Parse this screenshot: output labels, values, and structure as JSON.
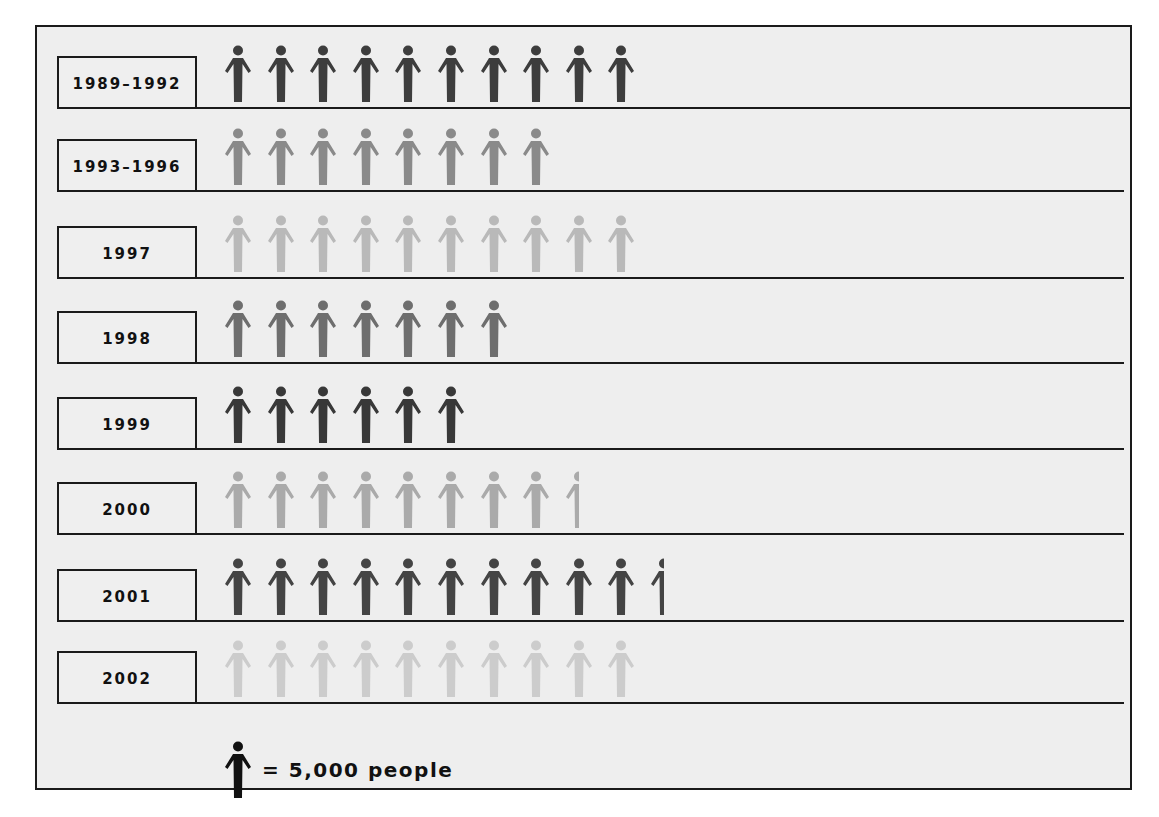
{
  "chart_data": {
    "type": "pictograph",
    "title": "",
    "unit_per_icon": 5000,
    "unit_label": "people",
    "categories": [
      "1989–1992",
      "1993–1996",
      "1997",
      "1998",
      "1999",
      "2000",
      "2001",
      "2002"
    ],
    "icon_counts": [
      10,
      8,
      10,
      7,
      6,
      8.5,
      10.5,
      10
    ],
    "values": [
      50000,
      40000,
      50000,
      35000,
      30000,
      42500,
      52500,
      50000
    ],
    "legend": "= 5,000 people",
    "row_colors": [
      "#3d3d3d",
      "#8a8a8a",
      "#b9b9b9",
      "#6e6e6e",
      "#383838",
      "#aaaaaa",
      "#444444",
      "#cccccc"
    ]
  },
  "rows": [
    {
      "label": "1989–1992",
      "count": 10,
      "color": "#3d3d3d"
    },
    {
      "label": "1993–1996",
      "count": 8,
      "color": "#8a8a8a"
    },
    {
      "label": "1997",
      "count": 10,
      "color": "#b9b9b9"
    },
    {
      "label": "1998",
      "count": 7,
      "color": "#6e6e6e"
    },
    {
      "label": "1999",
      "count": 6,
      "color": "#383838"
    },
    {
      "label": "2000",
      "count": 8.5,
      "color": "#aaaaaa"
    },
    {
      "label": "2001",
      "count": 10.5,
      "color": "#444444"
    },
    {
      "label": "2002",
      "count": 10,
      "color": "#cccccc"
    }
  ],
  "legend": {
    "text": "= 5,000 people",
    "icon": "person-icon",
    "color": "#111111"
  }
}
